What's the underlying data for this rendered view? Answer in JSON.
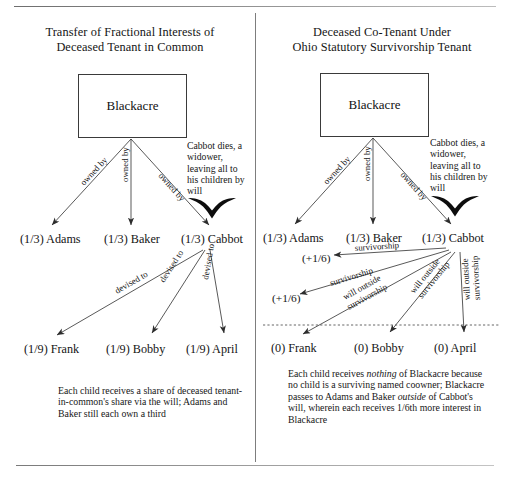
{
  "figure": {
    "panels": [
      {
        "id": "tenancy-in-common",
        "heading_line1": "Transfer of Fractional Interests of",
        "heading_line2": "Deceased Tenant in Common",
        "property_box_label": "Blackacre",
        "ownership_edge_label": "owned by",
        "devise_edge_label": "devised to",
        "death_note": "Cabbot dies, a widower, leaving all to his children by will",
        "owners": [
          {
            "share": "(1/3)",
            "name": "Adams"
          },
          {
            "share": "(1/3)",
            "name": "Baker"
          },
          {
            "share": "(1/3)",
            "name": "Cabbot"
          }
        ],
        "children": [
          {
            "share": "(1/9)",
            "name": "Frank"
          },
          {
            "share": "(1/9)",
            "name": "Bobby"
          },
          {
            "share": "(1/9)",
            "name": "April"
          }
        ],
        "caption": "Each child receives a share of deceased tenant-in-common's share via the will; Adams and Baker still each own a third"
      },
      {
        "id": "ohio-survivorship-tenancy",
        "heading_line1": "Deceased Co-Tenant Under",
        "heading_line2": "Ohio Statutory Survivorship Tenant",
        "property_box_label": "Blackacre",
        "ownership_edge_label": "owned by",
        "survivorship_edge_label": "survivorship",
        "will_edge_label_line1": "will outside",
        "will_edge_label_line2": "survivorship",
        "death_note": "Cabbot dies, a widower, leaving all to his children by will",
        "owners": [
          {
            "share": "(1/3)",
            "name": "Adams",
            "increment": "(+1/6)"
          },
          {
            "share": "(1/3)",
            "name": "Baker",
            "increment": "(+1/6)"
          },
          {
            "share": "(1/3)",
            "name": "Cabbot",
            "increment": ""
          }
        ],
        "children": [
          {
            "share": "(0)",
            "name": "Frank"
          },
          {
            "share": "(0)",
            "name": "Bobby"
          },
          {
            "share": "(0)",
            "name": "April"
          }
        ],
        "caption_part1": "Each child receives ",
        "caption_em1": "nothing",
        "caption_part2": " of Blackacre because no child is a surviving named coowner; Blackacre passes to Adams and Baker ",
        "caption_em2": "outside",
        "caption_part3": " of Cabbot's will, wherein each receives 1/6th more interest in Blackacre"
      }
    ],
    "colors": {
      "ink": "#141414",
      "rule": "#8a8a8a",
      "stroke": "#3b3b3b",
      "dashed_separator": "#555555"
    }
  }
}
